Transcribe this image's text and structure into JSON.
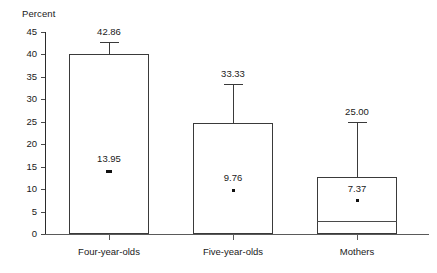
{
  "chart_data": {
    "type": "bar",
    "title": "",
    "subtitle": "",
    "xlabel": "",
    "ylabel": "Percent",
    "ylim": [
      0,
      45
    ],
    "ytick_values": [
      0,
      5,
      10,
      15,
      20,
      25,
      30,
      35,
      40,
      45
    ],
    "ytick_labels": [
      "0",
      "5",
      "10",
      "15",
      "20",
      "25",
      "30",
      "35",
      "40",
      "45"
    ],
    "grid": false,
    "legend": "none",
    "categories": [
      "Four-year-olds",
      "Five-year-olds",
      "Mothers"
    ],
    "values": [
      40.0,
      24.8,
      12.8
    ],
    "series": [
      {
        "name": "Bar top",
        "values": [
          40.0,
          24.8,
          12.8
        ]
      },
      {
        "name": "Upper whisker (labeled)",
        "values": [
          42.86,
          33.33,
          25.0
        ],
        "labels": [
          "42.86",
          "33.33",
          "25.00"
        ]
      },
      {
        "name": "Marker",
        "values": [
          13.95,
          9.76,
          7.37
        ],
        "labels": [
          "13.95",
          "9.76",
          "7.37"
        ]
      },
      {
        "name": "Inner line",
        "values": [
          null,
          null,
          2.8
        ]
      }
    ],
    "bars": [
      {
        "category": "Four-year-olds",
        "bar_top": 40.0,
        "whisker_top": 42.86,
        "whisker_label": "42.86",
        "marker_value": 13.95,
        "marker_label": "13.95",
        "inner_line": null
      },
      {
        "category": "Five-year-olds",
        "bar_top": 24.8,
        "whisker_top": 33.33,
        "whisker_label": "33.33",
        "marker_value": 9.76,
        "marker_label": "9.76",
        "inner_line": null
      },
      {
        "category": "Mothers",
        "bar_top": 12.8,
        "whisker_top": 25.0,
        "whisker_label": "25.00",
        "marker_value": 7.37,
        "marker_label": "7.37",
        "inner_line": 2.8
      }
    ],
    "colors": {
      "bar_fill": "#ffffff",
      "bar_stroke": "#3a3a3a",
      "axis": "#2b2b2b",
      "text": "#1a1a1a",
      "marker": "#111111",
      "background": "#ffffff"
    }
  }
}
